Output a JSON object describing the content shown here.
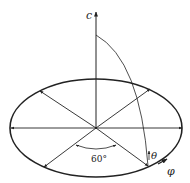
{
  "diagram": {
    "type": "hexagonal-lattice-basal-plane-with-c-axis",
    "axis_label": "c",
    "angle_label": "60°",
    "theta_label": "θ",
    "phi_label": "φ",
    "colors": {
      "stroke": "#222222",
      "background": "#ffffff"
    }
  }
}
